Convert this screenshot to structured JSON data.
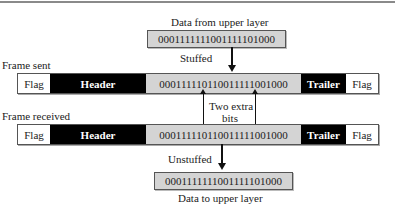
{
  "top": {
    "label": "Data from upper layer",
    "data": "0001111111001111101000"
  },
  "stuff_step": {
    "label": "Stuffed"
  },
  "frame_sent": {
    "label": "Frame sent",
    "segments": {
      "flag_left": "Flag",
      "header": "Header",
      "payload": "000111110110011111001000",
      "trailer": "Trailer",
      "flag_right": "Flag"
    }
  },
  "annotation": {
    "line1": "Two extra",
    "line2": "bits"
  },
  "frame_received": {
    "label": "Frame received",
    "segments": {
      "flag_left": "Flag",
      "header": "Header",
      "payload": "000111110110011111001000",
      "trailer": "Trailer",
      "flag_right": "Flag"
    }
  },
  "unstuff_step": {
    "label": "Unstuffed"
  },
  "bottom": {
    "data": "0001111111001111101000",
    "label": "Data to upper layer"
  },
  "colors": {
    "field_dark": "#000000",
    "payload_gray": "#d4d4d4",
    "flag_white": "#ffffff"
  }
}
